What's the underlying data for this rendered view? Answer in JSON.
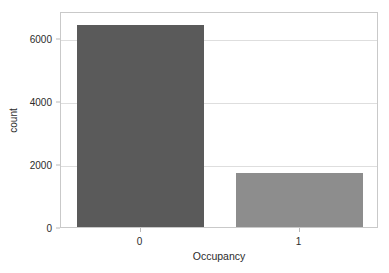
{
  "chart_data": {
    "type": "bar",
    "title": "",
    "subtitle": "",
    "categories": [
      "0",
      "1"
    ],
    "values": [
      6414,
      1729
    ],
    "series": [
      {
        "name": "count",
        "values": [
          6414,
          1729
        ]
      }
    ],
    "xlabel": "Occupancy",
    "ylabel": "count",
    "xlim": [
      -0.5,
      1.5
    ],
    "ylim": [
      0,
      6858
    ],
    "yticks": [
      0,
      2000,
      4000,
      6000
    ],
    "ytick_labels": [
      "0",
      "2000",
      "4000",
      "6000"
    ],
    "xticks": [
      0,
      1
    ],
    "xtick_labels": [
      "0",
      "1"
    ],
    "grid": true,
    "grid_axis": "y",
    "legend": false,
    "legend_position": "none",
    "annotations": [],
    "bar_colors": [
      "#5a5a5a",
      "#8d8d8d"
    ],
    "bar_width_ratio": 0.8
  },
  "style": {
    "background": "#ffffff",
    "plot_background": "#ffffff",
    "frame_color": "#c9c9c9",
    "grid_color": "#dedede",
    "tick_color": "#b9b9b9",
    "text_color": "#2b2b2b"
  }
}
